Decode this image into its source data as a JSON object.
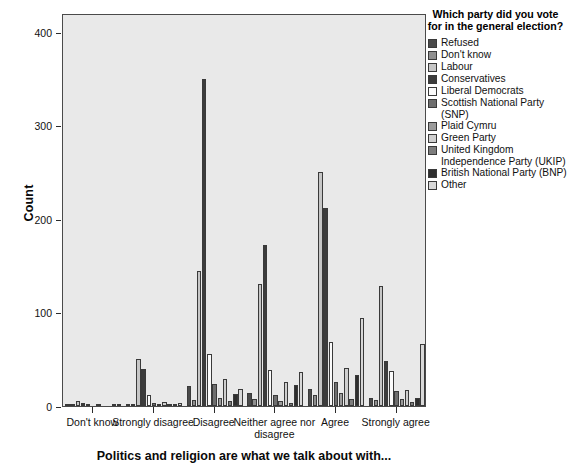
{
  "chart_data": {
    "type": "bar",
    "title": "",
    "subtitle": "",
    "xlabel": "Politics and religion are what we talk about with...",
    "ylabel": "Count",
    "ylim": [
      0,
      420
    ],
    "yticks": [
      0,
      100,
      200,
      300,
      400
    ],
    "grid": false,
    "legend_position": "right",
    "legend_title": "Which party did you vote for in the general election?",
    "categories": [
      "Don't know",
      "Strongly disagree",
      "Disagree",
      "Neither agree nor disagree",
      "Agree",
      "Strongly agree"
    ],
    "series": [
      {
        "name": "Refused",
        "color": "#4a4a4a",
        "values": [
          2,
          2,
          21,
          14,
          18,
          9
        ]
      },
      {
        "name": "Don't know",
        "color": "#8f8f8f",
        "values": [
          1,
          1,
          6,
          8,
          12,
          6
        ]
      },
      {
        "name": "Labour",
        "color": "#c6c6c6",
        "values": [
          5,
          50,
          144,
          130,
          250,
          128
        ]
      },
      {
        "name": "Conservatives",
        "color": "#3c3c3c",
        "values": [
          3,
          40,
          350,
          172,
          212,
          48
        ]
      },
      {
        "name": "Liberal Democrats",
        "color": "#fbfbfb",
        "values": [
          2,
          12,
          56,
          38,
          68,
          37
        ]
      },
      {
        "name": "Scottish National Party (SNP)",
        "color": "#6e6e6e",
        "values": [
          0,
          3,
          23,
          12,
          26,
          16
        ]
      },
      {
        "name": "Plaid Cymru",
        "color": "#9b9b9b",
        "values": [
          1,
          2,
          9,
          5,
          14,
          8
        ]
      },
      {
        "name": "Green Party",
        "color": "#cfcfcf",
        "values": [
          0,
          4,
          29,
          26,
          41,
          17
        ]
      },
      {
        "name": "United Kingdom Independence Party (UKIP)",
        "color": "#7d7d7d",
        "values": [
          0,
          1,
          5,
          3,
          7,
          4
        ]
      },
      {
        "name": "British National Party (BNP)",
        "color": "#2e2e2e",
        "values": [
          1,
          2,
          13,
          22,
          33,
          9
        ]
      },
      {
        "name": "Other",
        "color": "#d8d8d8",
        "values": [
          2,
          3,
          18,
          36,
          94,
          66
        ]
      }
    ]
  },
  "legend": {
    "title": "Which party did you vote for in the general election?",
    "items": [
      {
        "label": "Refused",
        "color": "#4a4a4a"
      },
      {
        "label": "Don't know",
        "color": "#8f8f8f"
      },
      {
        "label": "Labour",
        "color": "#c6c6c6"
      },
      {
        "label": "Conservatives",
        "color": "#3c3c3c"
      },
      {
        "label": "Liberal Democrats",
        "color": "#fbfbfb"
      },
      {
        "label": "Scottish National Party (SNP)",
        "color": "#6e6e6e"
      },
      {
        "label": "Plaid Cymru",
        "color": "#9b9b9b"
      },
      {
        "label": "Green Party",
        "color": "#cfcfcf"
      },
      {
        "label": "United Kingdom Independence Party (UKIP)",
        "color": "#7d7d7d"
      },
      {
        "label": "British National Party (BNP)",
        "color": "#2e2e2e"
      },
      {
        "label": "Other",
        "color": "#d8d8d8"
      }
    ]
  },
  "axes": {
    "y_title": "Count",
    "y_ticks": [
      "0",
      "100",
      "200",
      "300",
      "400"
    ],
    "x_categories": [
      "Don't know",
      "Strongly disagree",
      "Disagree",
      "Neither agree nor disagree",
      "Agree",
      "Strongly agree"
    ],
    "x_title": "Politics and religion are what we talk about with..."
  },
  "style": {
    "plot_background": "#e9e9e9",
    "frame_color": "#4a4a4a",
    "page_background": "#ffffff"
  }
}
